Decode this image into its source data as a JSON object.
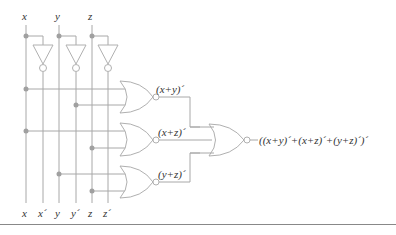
{
  "diagram": {
    "type": "logic-circuit",
    "inputs": {
      "top": [
        "x",
        "y",
        "z"
      ],
      "bottom": [
        "x",
        "x´",
        "y",
        "y´",
        "z",
        "z´"
      ]
    },
    "gates": [
      {
        "type": "NOT",
        "input": "x",
        "output": "x´"
      },
      {
        "type": "NOT",
        "input": "y",
        "output": "y´"
      },
      {
        "type": "NOT",
        "input": "z",
        "output": "z´"
      },
      {
        "type": "NOR",
        "inputs": [
          "x",
          "y"
        ],
        "label": "(x+y)´"
      },
      {
        "type": "NOR",
        "inputs": [
          "x",
          "z"
        ],
        "label": "(x+z)´"
      },
      {
        "type": "NOR",
        "inputs": [
          "y",
          "z"
        ],
        "label": "(y+z)´"
      },
      {
        "type": "NOR",
        "inputs": [
          "(x+y)´",
          "(x+z)´",
          "(y+z)´"
        ],
        "label": "((x+y)´+(x+z)´+(y+z)´)´"
      }
    ],
    "labels": {
      "top_x": "x",
      "top_y": "y",
      "top_z": "z",
      "bot_x": "x",
      "bot_xp": "x´",
      "bot_y": "y",
      "bot_yp": "y´",
      "bot_z": "z",
      "bot_zp": "z´",
      "nor1": "(x+y)´",
      "nor2": "(x+z)´",
      "nor3": "(y+z)´",
      "output": "((x+y)´+(x+z)´+(y+z)´)´"
    }
  }
}
